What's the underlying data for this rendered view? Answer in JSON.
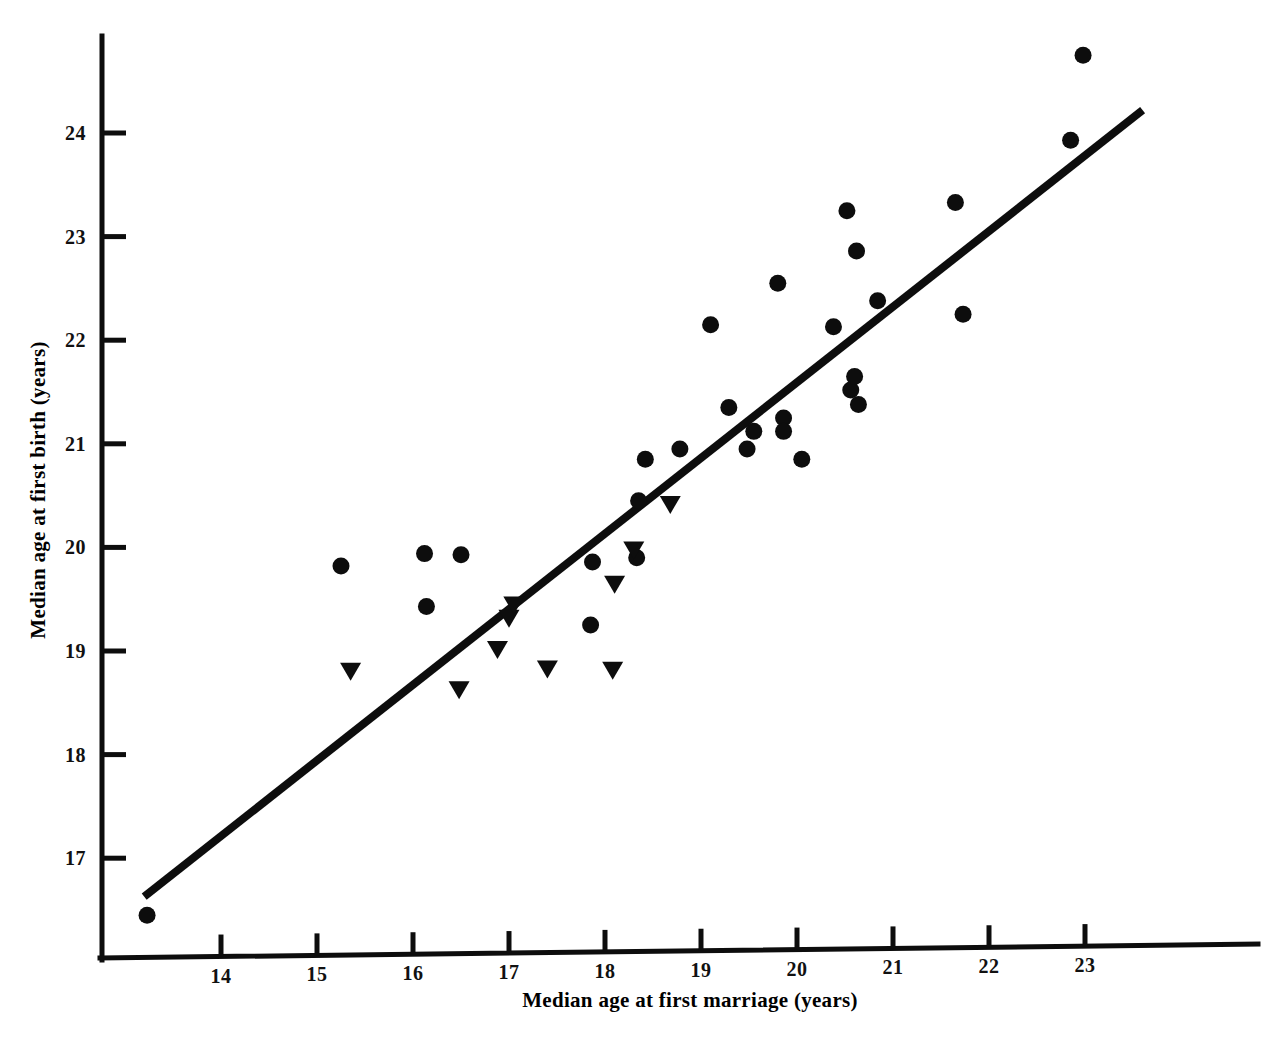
{
  "chart_data": {
    "type": "scatter",
    "title": "",
    "xlabel": "Median age at first marriage (years)",
    "ylabel": "Median age at first birth (years)",
    "xlim": [
      13.05,
      23.7
    ],
    "ylim": [
      16.15,
      24.9
    ],
    "xticks": [
      14,
      15,
      16,
      17,
      18,
      19,
      20,
      21,
      22,
      23
    ],
    "yticks": [
      17,
      18,
      19,
      20,
      21,
      22,
      23,
      24
    ],
    "xtick_labels": [
      "14",
      "15",
      "16",
      "17",
      "18",
      "19",
      "20",
      "21",
      "22",
      "23"
    ],
    "ytick_labels": [
      "17",
      "18",
      "19",
      "20",
      "21",
      "22",
      "23",
      "24"
    ],
    "grid": false,
    "legend": false,
    "marker_color": "#0d0d0d",
    "line_color": "#0d0d0d",
    "series": [
      {
        "name": "circle-series",
        "marker": "circle",
        "points": [
          [
            13.23,
            16.45
          ],
          [
            15.25,
            19.82
          ],
          [
            16.12,
            19.94
          ],
          [
            16.5,
            19.93
          ],
          [
            16.14,
            19.43
          ],
          [
            17.85,
            19.25
          ],
          [
            17.87,
            19.86
          ],
          [
            18.33,
            19.9
          ],
          [
            18.35,
            20.45
          ],
          [
            18.42,
            20.85
          ],
          [
            18.78,
            20.95
          ],
          [
            19.1,
            22.15
          ],
          [
            19.29,
            21.35
          ],
          [
            19.55,
            21.12
          ],
          [
            19.48,
            20.95
          ],
          [
            19.8,
            22.55
          ],
          [
            19.86,
            21.25
          ],
          [
            19.86,
            21.12
          ],
          [
            20.05,
            20.85
          ],
          [
            20.38,
            22.13
          ],
          [
            20.52,
            23.25
          ],
          [
            20.56,
            21.52
          ],
          [
            20.6,
            21.65
          ],
          [
            20.64,
            21.38
          ],
          [
            20.62,
            22.86
          ],
          [
            20.84,
            22.38
          ],
          [
            21.73,
            22.25
          ],
          [
            21.65,
            23.33
          ],
          [
            22.85,
            23.93
          ],
          [
            22.98,
            24.75
          ]
        ]
      },
      {
        "name": "triangle-series",
        "marker": "triangle-down",
        "points": [
          [
            15.35,
            18.81
          ],
          [
            16.48,
            18.63
          ],
          [
            16.88,
            19.02
          ],
          [
            17.0,
            19.32
          ],
          [
            17.05,
            19.45
          ],
          [
            17.4,
            18.83
          ],
          [
            18.08,
            18.82
          ],
          [
            18.1,
            19.65
          ],
          [
            18.3,
            19.98
          ],
          [
            18.68,
            20.42
          ]
        ]
      }
    ],
    "fit_line": {
      "name": "regression-line",
      "x_start": 13.2,
      "y_start": 16.63,
      "x_end": 23.6,
      "y_end": 24.22
    }
  },
  "axes": {
    "y_title": "Median age at first birth (years)",
    "x_title": "Median age at first marriage (years)"
  }
}
